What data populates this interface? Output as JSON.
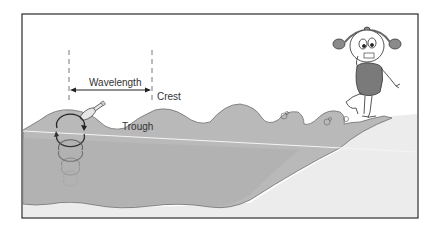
{
  "diagram": {
    "labels": {
      "wavelength": "Wavelength",
      "crest": "Crest",
      "trough": "Trough"
    },
    "colors": {
      "frame": "#2a2a2a",
      "water": "#b9b9b9",
      "water_deep": "#a9a9a9",
      "sand": "#ececec",
      "background": "#ffffff",
      "outline": "#6e6e6e"
    },
    "elements": [
      "wavelength-marker",
      "crest-label",
      "trough-label",
      "bottle",
      "orbital-circles",
      "breaking-waves",
      "beach",
      "girl-character",
      "still-water-line"
    ]
  }
}
